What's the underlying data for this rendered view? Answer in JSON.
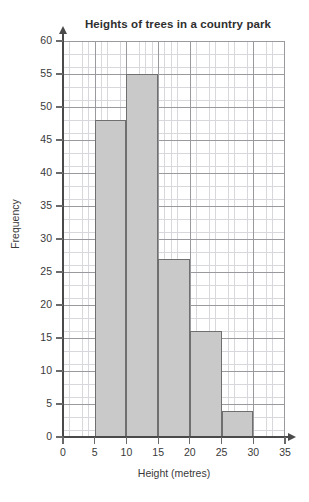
{
  "chart_data": {
    "type": "bar",
    "title": "Heights of trees in a country park",
    "xlabel": "Height (metres)",
    "ylabel": "Frequency",
    "categories": [
      "5-10",
      "10-15",
      "15-20",
      "20-25",
      "25-30"
    ],
    "bin_edges": [
      5,
      10,
      15,
      20,
      25,
      30
    ],
    "values": [
      48,
      55,
      27,
      16,
      4
    ],
    "xlim": [
      0,
      35
    ],
    "ylim": [
      0,
      60
    ],
    "xticks": [
      0,
      5,
      10,
      15,
      20,
      25,
      30,
      35
    ],
    "yticks": [
      0,
      5,
      10,
      15,
      20,
      25,
      30,
      35,
      40,
      45,
      50,
      55,
      60
    ],
    "x_tick_labels": [
      "0",
      "5",
      "10",
      "15",
      "20",
      "25",
      "30",
      "35"
    ],
    "y_tick_labels": [
      "0",
      "5",
      "10",
      "15",
      "20",
      "25",
      "30",
      "35",
      "40",
      "45",
      "50",
      "55",
      "60"
    ],
    "grid": true,
    "grid_minor_step": 1,
    "grid_major_step": 5,
    "legend": null,
    "bar_fill_color": "#c9c9c9",
    "bar_edge_color": "#6f6f6f",
    "axis_color": "#4a4a4a",
    "grid_minor_color": "#d8d8dc",
    "grid_major_color": "#9a9a9e",
    "background_color": "#ffffff"
  }
}
